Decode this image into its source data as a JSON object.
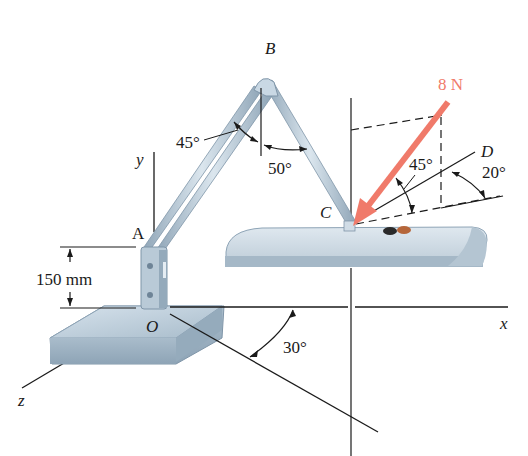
{
  "figure": {
    "type": "statics-3d-force-diagram"
  },
  "points": {
    "A": "A",
    "B": "B",
    "C": "C",
    "D": "D",
    "O": "O"
  },
  "axes": {
    "x": "x",
    "y": "y",
    "z": "z"
  },
  "force": {
    "label": "8 N",
    "color": "#f07a6a"
  },
  "angles": {
    "arm_AB_to_vertical": "45°",
    "arm_BC_to_vertical": "50°",
    "force_to_line_CD": "45°",
    "line_CD_to_horizontal": "20°",
    "base_line_to_x_axis": "30°"
  },
  "dimensions": {
    "height_OA": "150 mm"
  },
  "colors": {
    "metal_light": "#c9d8e4",
    "metal_mid": "#a9bccb",
    "metal_dark": "#7f95a8",
    "line": "#1a1a1a"
  }
}
